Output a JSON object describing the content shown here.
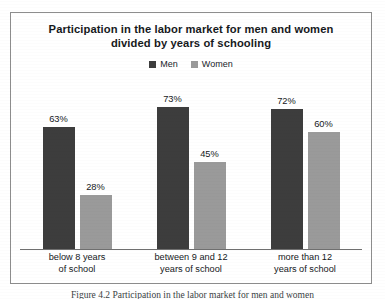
{
  "figure": {
    "title_line_1": "Participation in the labor market for men and women",
    "title_line_2": "divided by years of schooling",
    "caption": "Figure 4.2  Participation in the labor market for men and women"
  },
  "legend": {
    "items": [
      {
        "label": "Men",
        "color": "#3d3d3d",
        "swatch_icon": "square-swatch-icon"
      },
      {
        "label": "Women",
        "color": "#9a9a9a",
        "swatch_icon": "square-swatch-icon"
      }
    ]
  },
  "categories": [
    {
      "line_1": "below 8 years",
      "line_2": "of school"
    },
    {
      "line_1": "between 9 and 12",
      "line_2": "years of school"
    },
    {
      "line_1": "more than 12",
      "line_2": "years of school"
    }
  ],
  "values": {
    "men": [
      "63%",
      "73%",
      "72%"
    ],
    "women": [
      "28%",
      "45%",
      "60%"
    ]
  },
  "colors": {
    "men_bar": "#3d3d3d",
    "women_bar": "#9a9a9a",
    "frame_border": "#8d8d8d",
    "axis_line": "#6f6f6f",
    "text": "#15181b",
    "background": "#ffffff"
  },
  "chart_data": {
    "type": "bar",
    "title": "Participation in the labor market for men and women divided by years of schooling",
    "xlabel": "",
    "ylabel": "",
    "ylim": [
      0,
      100
    ],
    "unit": "percent",
    "grid": false,
    "legend_position": "top-center",
    "categories": [
      "below 8 years of school",
      "between 9 and 12 years of school",
      "more than 12 years of school"
    ],
    "series": [
      {
        "name": "Men",
        "color": "#3d3d3d",
        "values": [
          63,
          73,
          72
        ]
      },
      {
        "name": "Women",
        "color": "#9a9a9a",
        "values": [
          28,
          45,
          60
        ]
      }
    ],
    "data_labels": [
      "63%",
      "28%",
      "73%",
      "45%",
      "72%",
      "60%"
    ]
  }
}
